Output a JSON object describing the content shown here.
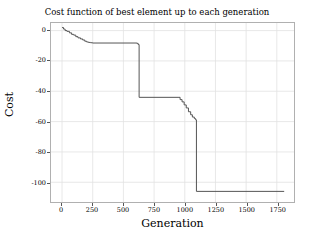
{
  "chart_data": {
    "type": "line",
    "title": "Cost function of best element up to each generation",
    "xlabel": "Generation",
    "ylabel": "Cost",
    "xlim": [
      -90,
      1890
    ],
    "ylim": [
      -113,
      5
    ],
    "xticks": [
      0,
      250,
      500,
      750,
      1000,
      1250,
      1500,
      1750
    ],
    "xtick_labels": [
      "0",
      "250",
      "500",
      "750",
      "1000",
      "1250",
      "1500",
      "1750"
    ],
    "yticks": [
      0,
      -20,
      -40,
      -60,
      -80,
      -100
    ],
    "ytick_labels": [
      "0",
      "-20",
      "-40",
      "-60",
      "-80",
      "-100"
    ],
    "grid": true,
    "legend": "none",
    "line_color": "#555555",
    "line_width": 1.0,
    "drawstyle": "steps-post",
    "series": [
      {
        "name": "best cost up to generation",
        "x": [
          0,
          12,
          25,
          40,
          60,
          78,
          95,
          112,
          130,
          150,
          168,
          185,
          200,
          215,
          232,
          248,
          610,
          620,
          628,
          945,
          962,
          978,
          995,
          1012,
          1030,
          1048,
          1062,
          1078,
          1088,
          1095,
          1810
        ],
        "y": [
          2.0,
          1.0,
          0.0,
          -0.5,
          -1.5,
          -2.5,
          -3.0,
          -4.0,
          -4.8,
          -5.5,
          -6.2,
          -7.0,
          -7.5,
          -7.8,
          -8.0,
          -8.2,
          -8.4,
          -9.2,
          -44.0,
          -44.0,
          -45.5,
          -47.0,
          -49.0,
          -51.0,
          -53.5,
          -55.5,
          -57.0,
          -58.0,
          -58.8,
          -106.0,
          -106.0
        ]
      }
    ]
  }
}
